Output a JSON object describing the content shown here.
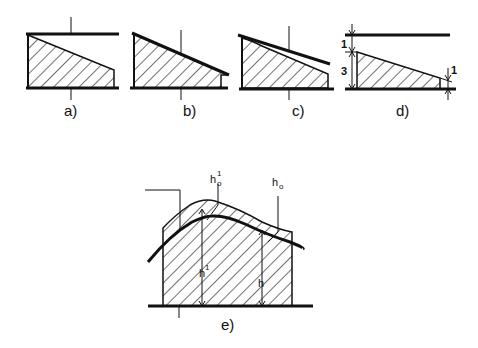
{
  "figure": {
    "panels": [
      {
        "id": "a",
        "label": "a)"
      },
      {
        "id": "b",
        "label": "b)"
      },
      {
        "id": "c",
        "label": "c)"
      },
      {
        "id": "d",
        "label": "d)",
        "dimensions": {
          "top_gap": "1",
          "height": "3",
          "right_gap": "1"
        }
      },
      {
        "id": "e",
        "label": "e)",
        "symbols": {
          "h0_prime": "h",
          "h0_prime_sub": "o",
          "h0_prime_sup": "1",
          "h0": "h",
          "h0_sub": "o",
          "h_prime": "h",
          "h_prime_sup": "1",
          "h": "h"
        }
      }
    ],
    "colors": {
      "ink": "#111111",
      "background": "#ffffff"
    }
  }
}
